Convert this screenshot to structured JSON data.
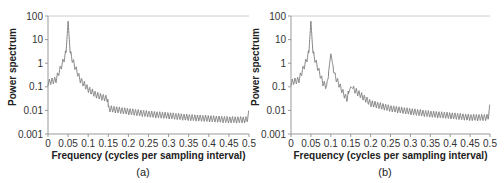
{
  "chart_data": [
    {
      "type": "line",
      "panel_label": "(a)",
      "title": "",
      "xlabel": "Frequency (cycles per sampling interval)",
      "ylabel": "Power spectrum",
      "xlim": [
        0,
        0.5
      ],
      "ylim": [
        0.001,
        100
      ],
      "yscale": "log",
      "x_ticks": [
        "0",
        "0.05",
        "0.1",
        "0.15",
        "0.2",
        "0.25",
        "0.3",
        "0.35",
        "0.4",
        "0.45",
        "0.5"
      ],
      "y_ticks": [
        "0.001",
        "0.01",
        "0.1",
        "1",
        "10",
        "100"
      ],
      "grid": false,
      "legend": null,
      "peaks": [
        {
          "x": 0.05,
          "y": 60
        }
      ],
      "annotations": [
        "discontinuity near x=0.15 (drop from ~0.03 to ~0.007)"
      ],
      "series": [
        {
          "name": "spectrum",
          "color": "#777777",
          "x": [
            0,
            0.02,
            0.04,
            0.045,
            0.05,
            0.055,
            0.06,
            0.08,
            0.1,
            0.12,
            0.149,
            0.15,
            0.2,
            0.25,
            0.3,
            0.35,
            0.4,
            0.45,
            0.495,
            0.5
          ],
          "y": [
            0.15,
            0.2,
            1.5,
            3,
            60,
            3,
            1.5,
            0.2,
            0.08,
            0.045,
            0.03,
            0.012,
            0.009,
            0.007,
            0.006,
            0.005,
            0.0045,
            0.004,
            0.004,
            0.008
          ]
        }
      ]
    },
    {
      "type": "line",
      "panel_label": "(b)",
      "title": "",
      "xlabel": "Frequency (cycles per sampling interval)",
      "ylabel": "Power spectrum",
      "xlim": [
        0,
        0.5
      ],
      "ylim": [
        0.001,
        100
      ],
      "yscale": "log",
      "x_ticks": [
        "0",
        "0.05",
        "0.1",
        "0.15",
        "0.2",
        "0.25",
        "0.3",
        "0.35",
        "0.4",
        "0.45",
        "0.5"
      ],
      "y_ticks": [
        "0.001",
        "0.01",
        "0.1",
        "1",
        "10",
        "100"
      ],
      "grid": false,
      "legend": null,
      "peaks": [
        {
          "x": 0.05,
          "y": 60
        },
        {
          "x": 0.1,
          "y": 2.5
        },
        {
          "x": 0.15,
          "y": 0.1
        }
      ],
      "series": [
        {
          "name": "spectrum",
          "color": "#777777",
          "x": [
            0,
            0.02,
            0.04,
            0.045,
            0.05,
            0.055,
            0.06,
            0.08,
            0.09,
            0.1,
            0.11,
            0.13,
            0.14,
            0.15,
            0.2,
            0.25,
            0.3,
            0.35,
            0.4,
            0.45,
            0.495,
            0.5
          ],
          "y": [
            0.15,
            0.2,
            1.5,
            3,
            60,
            3,
            1.5,
            0.15,
            0.1,
            2.5,
            0.3,
            0.06,
            0.03,
            0.1,
            0.02,
            0.012,
            0.009,
            0.007,
            0.006,
            0.005,
            0.005,
            0.015
          ]
        }
      ]
    }
  ],
  "figure": {
    "axis_color": "#999999",
    "line_color": "#777777"
  }
}
